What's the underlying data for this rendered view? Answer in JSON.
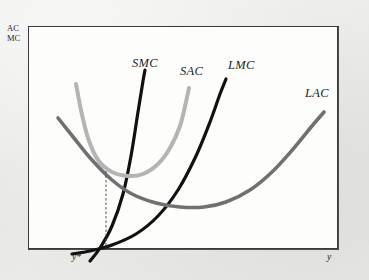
{
  "figure": {
    "vertical_axis_label_line1": "AC",
    "vertical_axis_label_line2": "MC",
    "horizontal_axis_label": "y",
    "optimum_output_label": "y*"
  },
  "colors": {
    "background": "#e9e9e7",
    "plot_background": "#fdfdfc",
    "frame_border": "#3a3a3a",
    "smc": "#111111",
    "lmc": "#111111",
    "sac": "#b4b4b4",
    "lac": "#707070",
    "dashed_line": "#555555",
    "text": "#1d1d1d"
  },
  "chart_data": {
    "type": "line",
    "title": "",
    "subtitle": "",
    "xlabel": "y",
    "ylabel": "AC MC",
    "xlim": [
      0,
      310
    ],
    "ylim": [
      0,
      223
    ],
    "grid": false,
    "legend": "inline-curve-labels",
    "annotations": [
      {
        "name": "y-star-dashed-line",
        "label": "y*",
        "x": 78,
        "type": "vertical-dashed-line",
        "note": "marks output where SMC crosses LMC and SAC is tangent to LAC"
      }
    ],
    "series": [
      {
        "name": "SMC",
        "label": "SMC",
        "color": "#111111",
        "width": 3.2,
        "description": "short-run marginal cost, steeply rising from lower-left",
        "points": [
          [
            62,
            235
          ],
          [
            72,
            222
          ],
          [
            84,
            200
          ],
          [
            95,
            168
          ],
          [
            103,
            130
          ],
          [
            110,
            86
          ],
          [
            115,
            55
          ],
          [
            117,
            44
          ]
        ]
      },
      {
        "name": "SAC",
        "label": "SAC",
        "color": "#b4b4b4",
        "width": 4.0,
        "description": "short-run average cost, U-shaped with minimum near y*",
        "points": [
          [
            48,
            58
          ],
          [
            53,
            84
          ],
          [
            60,
            112
          ],
          [
            70,
            134
          ],
          [
            84,
            146
          ],
          [
            100,
            150
          ],
          [
            115,
            148
          ],
          [
            130,
            138
          ],
          [
            142,
            122
          ],
          [
            152,
            100
          ],
          [
            158,
            76
          ],
          [
            161,
            62
          ]
        ]
      },
      {
        "name": "LMC",
        "label": "LMC",
        "color": "#111111",
        "width": 3.2,
        "description": "long-run marginal cost, rising through the SMC/SAC/LAC tangency",
        "points": [
          [
            44,
            228
          ],
          [
            62,
            225
          ],
          [
            84,
            219
          ],
          [
            108,
            208
          ],
          [
            130,
            190
          ],
          [
            150,
            164
          ],
          [
            168,
            130
          ],
          [
            182,
            96
          ],
          [
            192,
            68
          ],
          [
            198,
            53
          ]
        ]
      },
      {
        "name": "LAC",
        "label": "LAC",
        "color": "#707070",
        "width": 3.6,
        "description": "long-run average cost envelope, shallow U-shape tangent to SAC at y*",
        "points": [
          [
            30,
            92
          ],
          [
            46,
            112
          ],
          [
            64,
            134
          ],
          [
            84,
            154
          ],
          [
            104,
            168
          ],
          [
            128,
            177
          ],
          [
            152,
            181
          ],
          [
            176,
            181
          ],
          [
            198,
            176
          ],
          [
            222,
            164
          ],
          [
            244,
            146
          ],
          [
            266,
            122
          ],
          [
            284,
            100
          ],
          [
            296,
            86
          ]
        ]
      }
    ],
    "curve_labels": [
      {
        "text": "SMC",
        "x": 104,
        "y": 30
      },
      {
        "text": "SAC",
        "x": 152,
        "y": 38
      },
      {
        "text": "LMC",
        "x": 200,
        "y": 32
      },
      {
        "text": "LAC",
        "x": 277,
        "y": 60
      }
    ]
  }
}
